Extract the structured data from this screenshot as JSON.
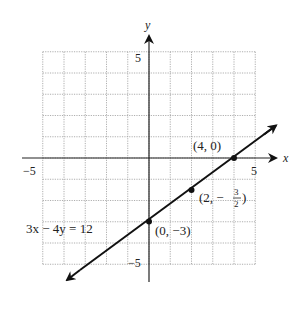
{
  "chart_data": {
    "type": "line",
    "title": "",
    "xlabel": "x",
    "ylabel": "y",
    "xlim": [
      -5,
      5
    ],
    "ylim": [
      -5,
      5
    ],
    "grid": true,
    "x_tick_labels": [
      "-5",
      "5"
    ],
    "y_tick_labels": [
      "5",
      "-5"
    ],
    "series": [
      {
        "name": "3x − 4y = 12",
        "equation": "3x - 4y = 12",
        "slope": 0.75,
        "intercept": -3,
        "x": [
          -3.8,
          6.0
        ],
        "y": [
          -5.85,
          1.5
        ]
      }
    ],
    "points": [
      {
        "x": 4,
        "y": 0,
        "label": "(4, 0)"
      },
      {
        "x": 2,
        "y": -1.5,
        "label": "(2, −3/2)"
      },
      {
        "x": 0,
        "y": -3,
        "label": "(0, −3)"
      }
    ],
    "annotations": [
      "3x − 4y = 12",
      "(4, 0)",
      "(2, −3/2)",
      "(0, −3)"
    ]
  },
  "labels": {
    "x_axis": "x",
    "y_axis": "y",
    "x_neg": "−5",
    "x_pos": "5",
    "y_pos": "5",
    "y_neg": "−5",
    "equation": "3x − 4y = 12",
    "p1": "(4, 0)",
    "p2_a": "(2, −",
    "p2_num": "3",
    "p2_den": "2",
    "p2_b": ")",
    "p3": "(0, −3)"
  }
}
